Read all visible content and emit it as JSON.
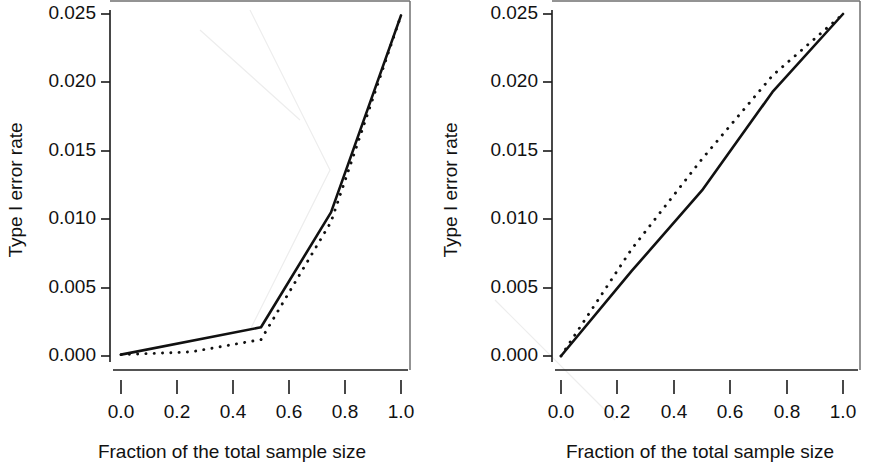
{
  "figure": {
    "background": "#ffffff",
    "ink_color": "#111111",
    "panel_count": 2
  },
  "chart_data": [
    {
      "type": "line",
      "panel": "left",
      "title": "",
      "xlabel": "Fraction of the total sample size",
      "ylabel": "Type I error rate",
      "xlim": [
        0.0,
        1.0
      ],
      "ylim": [
        0.0,
        0.025
      ],
      "xticks": [
        0.0,
        0.2,
        0.4,
        0.6,
        0.8,
        1.0
      ],
      "xticklabels": [
        "0.0",
        "0.2",
        "0.4",
        "0.6",
        "0.8",
        "1.0"
      ],
      "yticks": [
        0.0,
        0.005,
        0.01,
        0.015,
        0.02,
        0.025
      ],
      "yticklabels": [
        "0.000",
        "0.005",
        "0.010",
        "0.015",
        "0.020",
        "0.025"
      ],
      "grid": false,
      "legend": "none",
      "series": [
        {
          "name": "solid",
          "style": "solid",
          "x": [
            0.0,
            0.5,
            0.75,
            1.0
          ],
          "values": [
            0.0001,
            0.0021,
            0.0105,
            0.0249
          ]
        },
        {
          "name": "dotted",
          "style": "dotted",
          "x": [
            0.0,
            0.25,
            0.5,
            0.75,
            1.0
          ],
          "values": [
            0.0001,
            0.0003,
            0.0012,
            0.0098,
            0.0249
          ]
        }
      ]
    },
    {
      "type": "line",
      "panel": "right",
      "title": "",
      "xlabel": "Fraction of the total sample size",
      "ylabel": "Type I error rate",
      "xlim": [
        0.0,
        1.0
      ],
      "ylim": [
        0.0,
        0.025
      ],
      "xticks": [
        0.0,
        0.2,
        0.4,
        0.6,
        0.8,
        1.0
      ],
      "xticklabels": [
        "0.0",
        "0.2",
        "0.4",
        "0.6",
        "0.8",
        "1.0"
      ],
      "yticks": [
        0.0,
        0.005,
        0.01,
        0.015,
        0.02,
        0.025
      ],
      "yticklabels": [
        "0.000",
        "0.005",
        "0.010",
        "0.015",
        "0.020",
        "0.025"
      ],
      "grid": false,
      "legend": "none",
      "series": [
        {
          "name": "solid",
          "style": "solid",
          "x": [
            0.0,
            0.25,
            0.5,
            0.75,
            1.0
          ],
          "values": [
            0.0,
            0.0062,
            0.0121,
            0.0193,
            0.025
          ]
        },
        {
          "name": "dotted",
          "style": "dotted",
          "x": [
            0.0,
            0.25,
            0.5,
            0.75,
            1.0
          ],
          "values": [
            0.0,
            0.0078,
            0.0144,
            0.0205,
            0.025
          ]
        }
      ]
    }
  ],
  "labels": {
    "y_axis_title": "Type I error rate",
    "x_axis_title": "Fraction of the total sample size",
    "y_ticks": [
      "0.025",
      "0.020",
      "0.015",
      "0.010",
      "0.005",
      "0.000"
    ],
    "x_ticks": [
      "0.0",
      "0.2",
      "0.4",
      "0.6",
      "0.8",
      "1.0"
    ]
  }
}
